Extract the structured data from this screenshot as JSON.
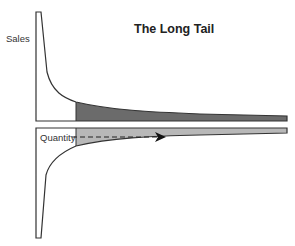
{
  "diagram": {
    "title": "The Long Tail",
    "top_panel": {
      "axis_label": "Sales",
      "head_fill": "#ffffff",
      "tail_fill": "#6b6b6b"
    },
    "bottom_panel": {
      "axis_label": "Quantity",
      "head_fill": "#ffffff",
      "tail_fill": "#b8b8b8",
      "arrow": "dashed arrow pointing right along the tail"
    },
    "stroke_color": "#333333"
  }
}
